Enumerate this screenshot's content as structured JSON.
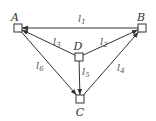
{
  "diagram": {
    "nodes": [
      {
        "id": "A",
        "label": "A",
        "x": 18,
        "y": 28,
        "lx": 15,
        "ly": 21
      },
      {
        "id": "B",
        "label": "B",
        "x": 142,
        "y": 28,
        "lx": 141,
        "ly": 21
      },
      {
        "id": "D",
        "label": "D",
        "x": 79,
        "y": 57,
        "lx": 78,
        "ly": 50
      },
      {
        "id": "C",
        "label": "C",
        "x": 80,
        "y": 99,
        "lx": 80,
        "ly": 116
      }
    ],
    "edges": [
      {
        "id": "l1",
        "label": "l",
        "sub": "1",
        "from": "B",
        "to": "A",
        "lx": 78,
        "ly": 22
      },
      {
        "id": "l2",
        "label": "l",
        "sub": "2",
        "from": "D",
        "to": "B",
        "lx": 100,
        "ly": 45
      },
      {
        "id": "l3",
        "label": "l",
        "sub": "3",
        "from": "D",
        "to": "A",
        "lx": 53,
        "ly": 45
      },
      {
        "id": "l4",
        "label": "l",
        "sub": "4",
        "from": "C",
        "to": "B",
        "lx": 117,
        "ly": 71
      },
      {
        "id": "l5",
        "label": "l",
        "sub": "5",
        "from": "D",
        "to": "C",
        "lx": 82,
        "ly": 75
      },
      {
        "id": "l6",
        "label": "l",
        "sub": "6",
        "from": "A",
        "to": "C",
        "lx": 36,
        "ly": 69
      }
    ]
  }
}
